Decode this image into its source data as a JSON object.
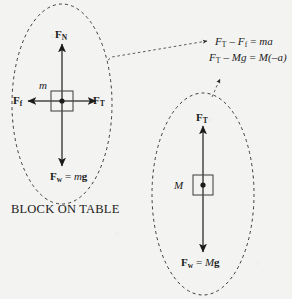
{
  "figure": {
    "background_color": "#f3f3f2",
    "ink_color": "#1b1b1b"
  },
  "left_system": {
    "caption": "BLOCK ON TABLE",
    "mass_label": "m",
    "normal_force": {
      "symbol": "F",
      "subscript": "N"
    },
    "tension_force": {
      "symbol": "F",
      "subscript": "T"
    },
    "friction_force": {
      "symbol": "F",
      "subscript": "f"
    },
    "weight_force": {
      "symbol": "F",
      "subscript": "w",
      "equals": "=",
      "mass": "m",
      "gravity": "g"
    },
    "ellipse": {
      "cx": 62,
      "cy": 104,
      "rx": 50,
      "ry": 100
    },
    "block": {
      "cx": 62,
      "cy": 101,
      "w": 22,
      "h": 20
    }
  },
  "right_system": {
    "mass_label": "M",
    "tension_force": {
      "symbol": "F",
      "subscript": "T"
    },
    "weight_force": {
      "symbol": "F",
      "subscript": "w",
      "equals": "=",
      "mass": "M",
      "gravity": "g"
    },
    "ellipse": {
      "cx": 203,
      "cy": 194,
      "rx": 51,
      "ry": 101
    },
    "block": {
      "cx": 203,
      "cy": 185,
      "w": 20,
      "h": 20
    }
  },
  "equations": [
    {
      "id": "block-equation",
      "parts": {
        "f1": "F",
        "sub1": "T",
        "minus": "–",
        "f2": "F",
        "sub2": "f",
        "equals": "=",
        "rhs": "ma"
      },
      "plain": "F_T – F_f = ma"
    },
    {
      "id": "hanging-equation",
      "parts": {
        "f1": "F",
        "sub1": "T",
        "minus": "–",
        "mg": "Mg",
        "equals": "=",
        "rhs": "M(–a)"
      },
      "plain": "F_T – Mg = M(–a)"
    }
  ]
}
